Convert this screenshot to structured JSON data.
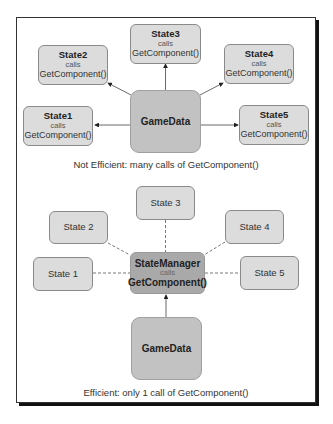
{
  "top_diagram": {
    "center": {
      "label": "GameData"
    },
    "states": [
      {
        "title": "State1",
        "calls": "calls",
        "fn": "GetComponent()"
      },
      {
        "title": "State2",
        "calls": "calls",
        "fn": "GetComponent()"
      },
      {
        "title": "State3",
        "calls": "calls",
        "fn": "GetComponent()"
      },
      {
        "title": "State4",
        "calls": "calls",
        "fn": "GetComponent()"
      },
      {
        "title": "State5",
        "calls": "calls",
        "fn": "GetComponent()"
      }
    ],
    "caption": "Not Efficient: many calls of GetComponent()"
  },
  "bottom_diagram": {
    "manager": {
      "title": "StateManager",
      "calls": "calls",
      "fn": "GetComponent()"
    },
    "data": {
      "label": "GameData"
    },
    "states": [
      {
        "label": "State 1"
      },
      {
        "label": "State 2"
      },
      {
        "label": "State 3"
      },
      {
        "label": "State 4"
      },
      {
        "label": "State 5"
      }
    ],
    "caption": "Efficient: only 1 call of GetComponent()"
  },
  "colors": {
    "state_fill": "#dcdcdc",
    "gamedata_fill": "#c2c2c2",
    "manager_fill": "#a9a9a9",
    "frame_shadow": "#111111"
  }
}
